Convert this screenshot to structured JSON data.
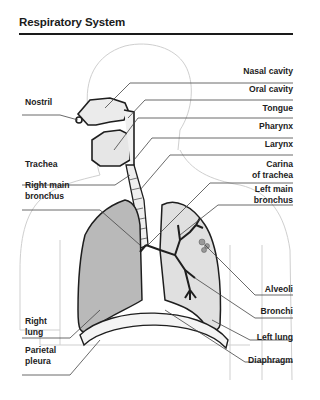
{
  "title": "Respiratory System",
  "colors": {
    "right_lung": "#b9b9b9",
    "left_lung": "#e0e0e0",
    "outline": "#1e1e1e",
    "body_outline": "#c8c8c8",
    "leader_line": "#444444"
  },
  "labels_right": [
    {
      "id": "nasal-cavity",
      "text": "Nasal cavity"
    },
    {
      "id": "oral-cavity",
      "text": "Oral cavity"
    },
    {
      "id": "tongue",
      "text": "Tongue"
    },
    {
      "id": "pharynx",
      "text": "Pharynx"
    },
    {
      "id": "larynx",
      "text": "Larynx"
    },
    {
      "id": "carina",
      "text": "Carina",
      "text2": "of trachea"
    },
    {
      "id": "left-main-bronchus",
      "text": "Left main",
      "text2": "bronchus"
    },
    {
      "id": "alveoli",
      "text": "Alveoli"
    },
    {
      "id": "bronchi",
      "text": "Bronchi"
    },
    {
      "id": "left-lung",
      "text": "Left lung"
    },
    {
      "id": "diaphragm",
      "text": "Diaphragm"
    }
  ],
  "labels_left": [
    {
      "id": "nostril",
      "text": "Nostril"
    },
    {
      "id": "trachea",
      "text": "Trachea"
    },
    {
      "id": "right-main-bronchus",
      "text": "Right main",
      "text2": "bronchus"
    },
    {
      "id": "right-lung",
      "text": "Right",
      "text2": "lung"
    },
    {
      "id": "parietal-pleura",
      "text": "Parietal",
      "text2": "pleura"
    }
  ]
}
